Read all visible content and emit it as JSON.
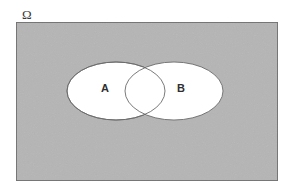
{
  "figure": {
    "type": "venn-diagram",
    "universe": {
      "label": "Ω",
      "name": "omega-sample-space",
      "fill_color": "#d2d2d2",
      "border_color": "#6e6e6e",
      "rect": {
        "x": 16,
        "y": 22,
        "width": 262,
        "height": 159
      },
      "label_position": {
        "x": 22,
        "y": 19
      }
    },
    "sets": [
      {
        "label": "A",
        "name": "set-a",
        "fill_color": "#ffffff",
        "stroke_color": "#6b6b6b",
        "ellipse": {
          "cx": 116,
          "cy": 91,
          "rx": 49,
          "ry": 29
        },
        "label_position": {
          "x": 105,
          "y": 89
        }
      },
      {
        "label": "B",
        "name": "set-b",
        "fill_color": "#ffffff",
        "stroke_color": "#6b6b6b",
        "ellipse": {
          "cx": 174,
          "cy": 91,
          "rx": 49,
          "ry": 29
        },
        "label_position": {
          "x": 181,
          "y": 89
        }
      }
    ],
    "intersection": {
      "name": "a-intersect-b",
      "label": "",
      "fill_color": "#ffffff",
      "crossing_points": [
        {
          "x": 145,
          "y": 62
        },
        {
          "x": 145,
          "y": 120
        }
      ]
    },
    "colors": {
      "background": "#ffffff",
      "universe_fill": "#d2d2d2",
      "universe_border": "#6e6e6e",
      "set_fill": "#ffffff",
      "set_stroke": "#6b6b6b",
      "text": "#2f2f2f"
    }
  }
}
